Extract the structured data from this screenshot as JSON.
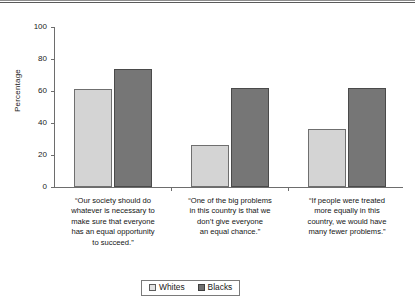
{
  "chart_data": {
    "type": "bar",
    "title": "",
    "xlabel": "",
    "ylabel": "Percentage",
    "ylim": [
      0,
      100
    ],
    "yticks": [
      0,
      20,
      40,
      60,
      80,
      100
    ],
    "ytick_labels": [
      "0",
      "20",
      "40",
      "60",
      "80",
      "100"
    ],
    "grid": false,
    "legend_position": "bottom-center",
    "categories": [
      "“Our society should do whatever is necessary to make sure that everyone has an equal opportunity to succeed.”",
      "“One of the big problems in this country is that we don’t give everyone an equal chance.”",
      "“If people were treated more equally in this country, we would have many fewer problems.”"
    ],
    "category_lines": [
      [
        "“Our society should do",
        "whatever is necessary to",
        "make sure that everyone",
        "has an equal opportunity",
        "to succeed.”"
      ],
      [
        "“One of the big problems",
        "in this country is that we",
        "don’t give everyone",
        "an equal chance.”"
      ],
      [
        "“If people were treated",
        "more equally in this",
        "country, we would have",
        "many fewer problems.”"
      ]
    ],
    "series": [
      {
        "name": "Whites",
        "color": "#d4d4d4",
        "values": [
          61,
          26,
          36
        ]
      },
      {
        "name": "Blacks",
        "color": "#767676",
        "values": [
          74,
          62,
          62
        ]
      }
    ]
  },
  "legend": {
    "entries": [
      {
        "label": "Whites"
      },
      {
        "label": "Blacks"
      }
    ]
  },
  "colors": {
    "whites_fill": "#d4d4d4",
    "blacks_fill": "#767676",
    "axis": "#6d6d6d",
    "text": "#141414"
  }
}
